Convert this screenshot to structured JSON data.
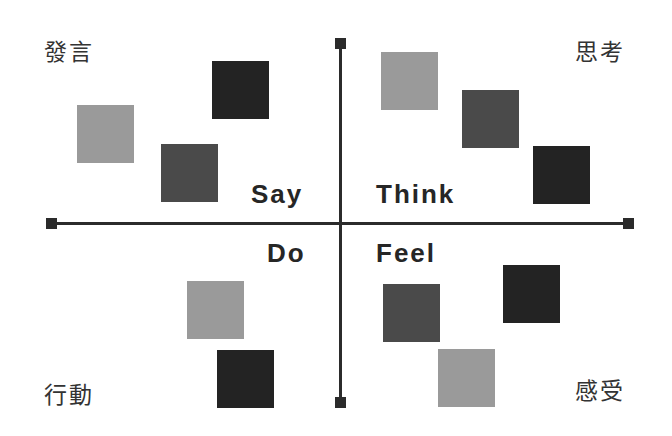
{
  "diagram": {
    "type": "empathy-map-quadrants",
    "colors": {
      "light": "#9a9a9a",
      "dark": "#4a4a4a",
      "black": "#232323",
      "axis": "#2b2b2b"
    },
    "quadrants": [
      {
        "id": "say",
        "english": "Say",
        "chinese": "發言",
        "position": "top-left"
      },
      {
        "id": "think",
        "english": "Think",
        "chinese": "思考",
        "position": "top-right"
      },
      {
        "id": "do",
        "english": "Do",
        "chinese": "行動",
        "position": "bottom-left"
      },
      {
        "id": "feel",
        "english": "Feel",
        "chinese": "感受",
        "position": "bottom-right"
      }
    ],
    "squares": [
      {
        "quadrant": "say",
        "shade": "light",
        "x": 77,
        "y": 105
      },
      {
        "quadrant": "say",
        "shade": "black",
        "x": 212,
        "y": 61
      },
      {
        "quadrant": "say",
        "shade": "dark",
        "x": 161,
        "y": 144
      },
      {
        "quadrant": "think",
        "shade": "light",
        "x": 381,
        "y": 52
      },
      {
        "quadrant": "think",
        "shade": "dark",
        "x": 462,
        "y": 90
      },
      {
        "quadrant": "think",
        "shade": "black",
        "x": 533,
        "y": 146
      },
      {
        "quadrant": "do",
        "shade": "light",
        "x": 187,
        "y": 281
      },
      {
        "quadrant": "do",
        "shade": "black",
        "x": 217,
        "y": 350
      },
      {
        "quadrant": "feel",
        "shade": "dark",
        "x": 383,
        "y": 284
      },
      {
        "quadrant": "feel",
        "shade": "black",
        "x": 503,
        "y": 265
      },
      {
        "quadrant": "feel",
        "shade": "light",
        "x": 438,
        "y": 349
      }
    ]
  }
}
